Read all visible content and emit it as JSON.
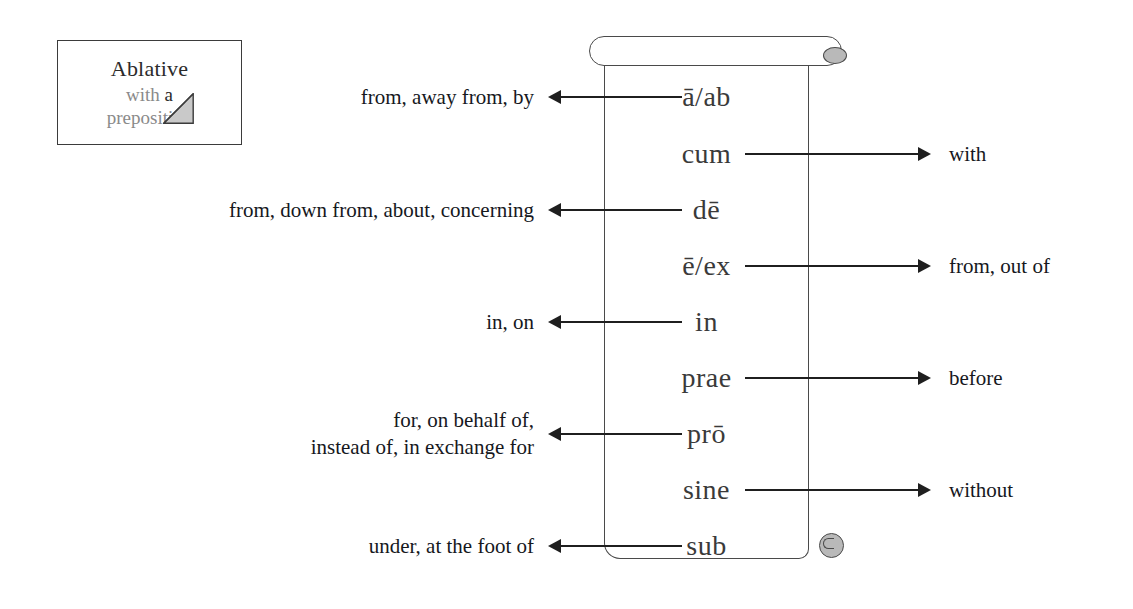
{
  "note": {
    "title": "Ablative",
    "line2_pre": "with ",
    "line2_em": "a",
    "line3": "preposition"
  },
  "diagram": {
    "title_semantic": "latin-ablative-prepositions-scroll",
    "rows": [
      {
        "latin": "ā/ab",
        "gloss": "from, away from, by",
        "side": "left",
        "y": 97
      },
      {
        "latin": "cum",
        "gloss": "with",
        "side": "right",
        "y": 154
      },
      {
        "latin": "dē",
        "gloss": "from, down from, about, concerning",
        "side": "left",
        "y": 210
      },
      {
        "latin": "ē/ex",
        "gloss": "from, out of",
        "side": "right",
        "y": 266
      },
      {
        "latin": "in",
        "gloss": "in, on",
        "side": "left",
        "y": 322
      },
      {
        "latin": "prae",
        "gloss": "before",
        "side": "right",
        "y": 378
      },
      {
        "latin": "prō",
        "gloss": "for, on behalf of,\ninstead of, in exchange  for",
        "side": "left",
        "y": 434
      },
      {
        "latin": "sine",
        "gloss": "without",
        "side": "right",
        "y": 490
      },
      {
        "latin": "sub",
        "gloss": "under, at the foot of",
        "side": "left",
        "y": 546
      }
    ]
  },
  "colors": {
    "ink": "#1f1f1f",
    "scroll_outline": "#4a4a4a",
    "knob_fill": "#b9b9b9",
    "note_muted_text": "#8a8a8a",
    "latin_text": "#3a3a3a",
    "page_background": "#ffffff"
  }
}
